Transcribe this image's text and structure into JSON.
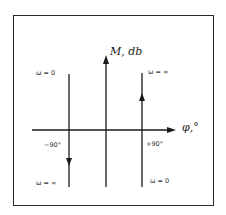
{
  "diagram": {
    "type": "phase-magnitude plot (Nichols-style)",
    "axes": {
      "vertical": {
        "label": "M, db"
      },
      "horizontal": {
        "label": "φ,°"
      }
    },
    "lines": [
      {
        "name": "left-line",
        "phase": "−90°",
        "top_label": "ω = 0",
        "bottom_label": "ω = ∞",
        "direction": "down"
      },
      {
        "name": "right-line",
        "phase": "+90°",
        "top_label": "ω = ∞",
        "bottom_label": "ω = 0",
        "direction": "up"
      }
    ],
    "colors": {
      "ink": "#1a1a1a",
      "background": "#ffffff"
    }
  }
}
